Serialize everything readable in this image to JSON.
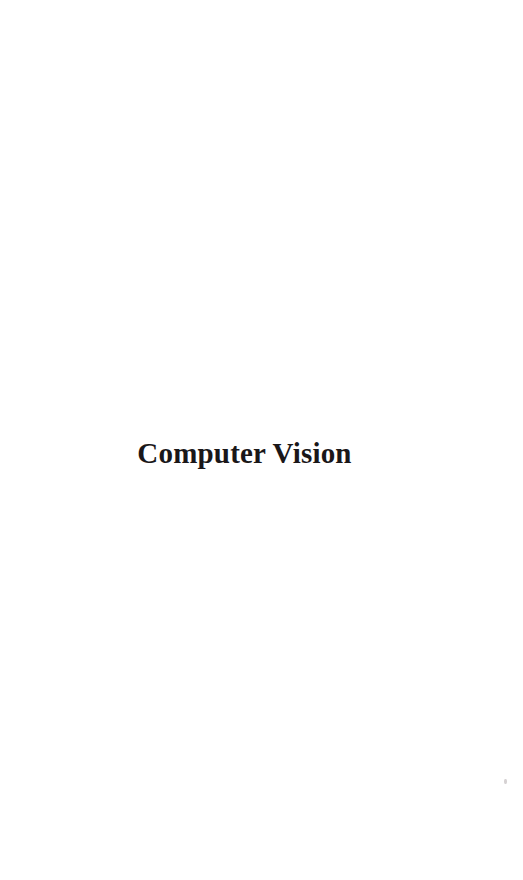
{
  "page": {
    "kind": "scanned-book-part-title-page",
    "width": 523,
    "height": 880,
    "background_color": "#ffffff",
    "ink_color": "#1a1719"
  },
  "title_block": {
    "part_title": "Computer Vision",
    "alignment": "center",
    "emphasis": "bold"
  },
  "artifacts": {
    "speck_label": ""
  },
  "blank_areas": {
    "above_title_label": "",
    "below_title_label": ""
  }
}
